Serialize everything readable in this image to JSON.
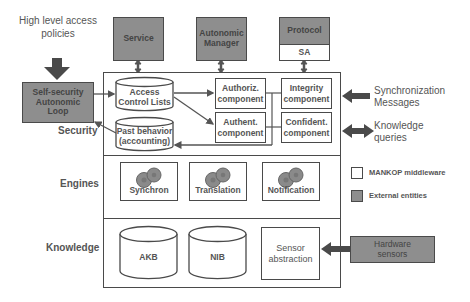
{
  "left": {
    "policies_label": "High level access policies",
    "loop_box": "Self-security Autonomic Loop"
  },
  "external_top": {
    "service": "Service",
    "autonomic_manager": "Autonomic Manager",
    "protocol": "Protocol",
    "sa": "SA"
  },
  "layers": {
    "security": "Security",
    "engines": "Engines",
    "knowledge": "Knowledge"
  },
  "security": {
    "acl": "Access Control Lists",
    "past_behavior": "Past behavior (accounting)",
    "authoriz": "Authoriz. component",
    "authent": "Authent. component",
    "integrity": "Integrity component",
    "confident": "Confident. component"
  },
  "engines": {
    "items": [
      {
        "label": "Synchron",
        "icon": "gears-icon"
      },
      {
        "label": "Translation",
        "icon": "gears-icon"
      },
      {
        "label": "Notification",
        "icon": "gears-icon"
      }
    ]
  },
  "knowledge": {
    "akb": "AKB",
    "nib": "NIB",
    "sensor": "Sensor abstraction"
  },
  "right": {
    "sync_messages": "Synchronization Messages",
    "knowledge_queries": "Knowledge queries",
    "hardware_sensors": "Hardware sensors"
  },
  "legend": {
    "items": [
      {
        "label": "MANKOP middleware",
        "color": "#ffffff"
      },
      {
        "label": "External entities",
        "color": "#8e8e8e"
      }
    ]
  }
}
